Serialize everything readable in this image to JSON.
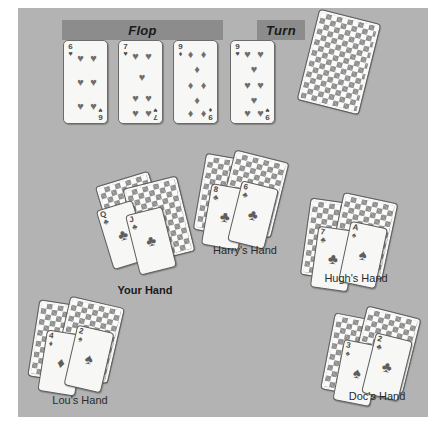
{
  "scene": {
    "title": "Texas Hold'em table illustration",
    "panel_color": "#b3b3b3",
    "banner_color": "#8c8c8c"
  },
  "stages": [
    {
      "id": "flop",
      "label": "Flop"
    },
    {
      "id": "turn",
      "label": "Turn"
    }
  ],
  "community_cards": [
    {
      "stage": "Flop",
      "rank": "6",
      "suit": "hearts",
      "suit_glyph": "♥",
      "pip_count": 6
    },
    {
      "stage": "Flop",
      "rank": "7",
      "suit": "hearts",
      "suit_glyph": "♥",
      "pip_count": 7
    },
    {
      "stage": "Flop",
      "rank": "9",
      "suit": "diamonds",
      "suit_glyph": "♦",
      "pip_count": 9
    },
    {
      "stage": "Turn",
      "rank": "9",
      "suit": "hearts",
      "suit_glyph": "♥",
      "pip_count": 9
    }
  ],
  "deck_card": {
    "label": "face-down card",
    "face_up": false
  },
  "hands": [
    {
      "id": "you",
      "label": "Your Hand",
      "emphasis": "bold",
      "cards": [
        {
          "rank": "Q",
          "suit": "clubs",
          "suit_glyph": "♣"
        },
        {
          "rank": "J",
          "suit": "clubs",
          "suit_glyph": "♣"
        }
      ]
    },
    {
      "id": "harry",
      "label": "Harry's Hand",
      "emphasis": "normal",
      "cards": [
        {
          "rank": "8",
          "suit": "clubs",
          "suit_glyph": "♣"
        },
        {
          "rank": "6",
          "suit": "clubs",
          "suit_glyph": "♣"
        }
      ]
    },
    {
      "id": "hugh",
      "label": "Hugh's Hand",
      "emphasis": "normal",
      "cards": [
        {
          "rank": "7",
          "suit": "clubs",
          "suit_glyph": "♣"
        },
        {
          "rank": "A",
          "suit": "spades",
          "suit_glyph": "♠"
        }
      ]
    },
    {
      "id": "lou",
      "label": "Lou's Hand",
      "emphasis": "normal",
      "cards": [
        {
          "rank": "4",
          "suit": "diamonds",
          "suit_glyph": "♦"
        },
        {
          "rank": "2",
          "suit": "spades",
          "suit_glyph": "♠"
        }
      ]
    },
    {
      "id": "doc",
      "label": "Doc's Hand",
      "emphasis": "normal",
      "cards": [
        {
          "rank": "3",
          "suit": "spades",
          "suit_glyph": "♠"
        },
        {
          "rank": "2",
          "suit": "clubs",
          "suit_glyph": "♣"
        }
      ]
    }
  ]
}
